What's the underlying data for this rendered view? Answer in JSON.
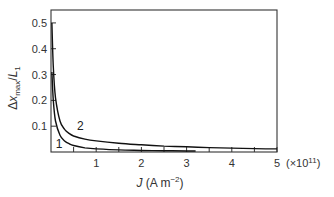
{
  "chart_data": {
    "type": "line",
    "title": "",
    "xlabel": "J (A m⁻²)",
    "xlabel_parts": {
      "var": "J",
      "unit": "(A m",
      "exp": "−2",
      "close": ")"
    },
    "x_multiplier": "(×10",
    "x_multiplier_exp": "11",
    "x_multiplier_close": ")",
    "ylabel": "Δx_max/L_1",
    "ylabel_parts": {
      "delta": "Δ",
      "var": "x",
      "sub": "max",
      "slash": "/",
      "var2": "L",
      "sub2": "1"
    },
    "xlim": [
      0,
      5
    ],
    "ylim": [
      0,
      0.55
    ],
    "x_ticks": [
      0,
      1,
      2,
      3,
      4,
      5
    ],
    "x_tick_labels": [
      "",
      "1",
      "2",
      "3",
      "4",
      "5"
    ],
    "x_minor_ticks": [
      0.5,
      1.5,
      2.5,
      3.5,
      4.5
    ],
    "y_ticks": [
      0.1,
      0.2,
      0.3,
      0.4,
      0.5
    ],
    "y_tick_labels": [
      "0.1",
      "0.2",
      "0.3",
      "0.4",
      "0.5"
    ],
    "grid": false,
    "legend": "inline curve labels",
    "series": [
      {
        "name": "1",
        "x": [
          0.02,
          0.05,
          0.1,
          0.2,
          0.3,
          0.4,
          0.5,
          0.75,
          1.0,
          1.5,
          2.0,
          2.5,
          3.0,
          3.2
        ],
        "values": [
          0.31,
          0.2,
          0.12,
          0.065,
          0.043,
          0.032,
          0.025,
          0.016,
          0.012,
          0.008,
          0.006,
          0.005,
          0.004,
          0.004
        ],
        "label_pos": {
          "x": 0.18,
          "y": 0.015
        }
      },
      {
        "name": "2",
        "x": [
          0.02,
          0.05,
          0.1,
          0.2,
          0.3,
          0.4,
          0.5,
          0.75,
          1.0,
          1.5,
          2.0,
          2.5,
          3.0,
          3.5,
          4.0,
          4.5,
          5.0
        ],
        "values": [
          0.5,
          0.33,
          0.21,
          0.12,
          0.088,
          0.072,
          0.062,
          0.05,
          0.043,
          0.034,
          0.028,
          0.023,
          0.02,
          0.017,
          0.015,
          0.013,
          0.012
        ],
        "label_pos": {
          "x": 0.65,
          "y": 0.085
        }
      }
    ]
  }
}
